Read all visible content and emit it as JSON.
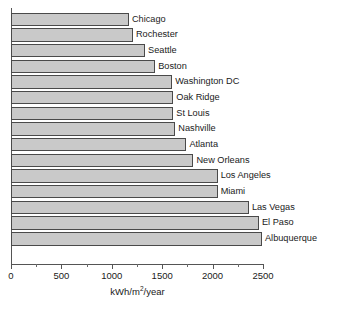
{
  "chart_data": {
    "type": "bar",
    "orientation": "horizontal",
    "title": "",
    "xlabel": "kWh/m2/year",
    "xlabel_parts": {
      "prefix": "kWh/m",
      "exponent": "2",
      "suffix": "/year"
    },
    "ylabel": "",
    "xlim": [
      0,
      2500
    ],
    "xticks": [
      0,
      500,
      1000,
      1500,
      2000,
      2500
    ],
    "xtick_labels": [
      "0",
      "500",
      "1000",
      "1500",
      "2000",
      "2500"
    ],
    "minor_xticks": [
      250,
      750,
      1250,
      1750,
      2250
    ],
    "grid": false,
    "legend": false,
    "bar_fill_color": "#c9c9c9",
    "bar_edge_color": "#4a4a4a",
    "axis_color": "#555555",
    "categories": [
      "Chicago",
      "Rochester",
      "Seattle",
      "Boston",
      "Washington DC",
      "Oak Ridge",
      "St Louis",
      "Nashville",
      "Atlanta",
      "New Orleans",
      "Los Angeles",
      "Miami",
      "Las Vegas",
      "El Paso",
      "Albuquerque"
    ],
    "values": [
      1170,
      1210,
      1330,
      1430,
      1600,
      1610,
      1610,
      1630,
      1740,
      1810,
      2050,
      2050,
      2360,
      2460,
      2490
    ],
    "bars": [
      {
        "label": "Chicago",
        "value": 1170
      },
      {
        "label": "Rochester",
        "value": 1210
      },
      {
        "label": "Seattle",
        "value": 1330
      },
      {
        "label": "Boston",
        "value": 1430
      },
      {
        "label": "Washington DC",
        "value": 1600
      },
      {
        "label": "Oak Ridge",
        "value": 1610
      },
      {
        "label": "St Louis",
        "value": 1610
      },
      {
        "label": "Nashville",
        "value": 1630
      },
      {
        "label": "Atlanta",
        "value": 1740
      },
      {
        "label": "New Orleans",
        "value": 1810
      },
      {
        "label": "Los Angeles",
        "value": 2050
      },
      {
        "label": "Miami",
        "value": 2050
      },
      {
        "label": "Las Vegas",
        "value": 2360
      },
      {
        "label": "El Paso",
        "value": 2460
      },
      {
        "label": "Albuquerque",
        "value": 2490
      }
    ]
  }
}
